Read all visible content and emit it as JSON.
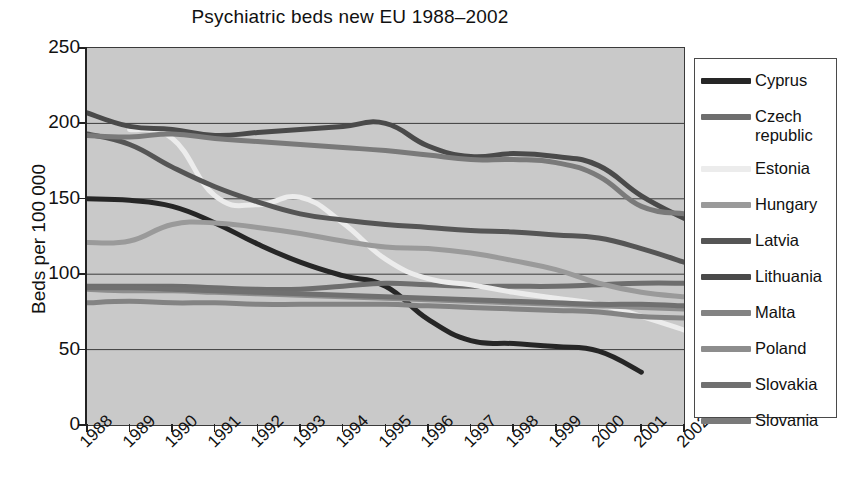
{
  "chart_data": {
    "type": "line",
    "title": "Psychiatric beds new EU 1988–2002",
    "xlabel": "",
    "ylabel": "Beds per 100 000",
    "x": [
      1988,
      1989,
      1990,
      1991,
      1992,
      1993,
      1994,
      1995,
      1996,
      1997,
      1998,
      1999,
      2000,
      2001,
      2002
    ],
    "xlim": [
      1988,
      2002
    ],
    "ylim": [
      0,
      250
    ],
    "yticks": [
      0,
      50,
      100,
      150,
      200,
      250
    ],
    "xticks": [
      "1988",
      "1989",
      "1990",
      "1991",
      "1992",
      "1993",
      "1994",
      "1995",
      "1996",
      "1997",
      "1998",
      "1999",
      "2000",
      "2001",
      "2002"
    ],
    "grid": "horizontal",
    "legend_position": "right",
    "plot_background": "#c9c9c9",
    "series": [
      {
        "name": "Cyprus",
        "color": "#262626",
        "values": [
          150,
          149,
          145,
          134,
          120,
          108,
          99,
          92,
          70,
          56,
          54,
          52,
          49,
          35,
          null
        ]
      },
      {
        "name": "Czech republic",
        "color": "#6e6e6e",
        "values": [
          92,
          92,
          92,
          91,
          90,
          90,
          92,
          94,
          93,
          92,
          92,
          92,
          93,
          94,
          94
        ]
      },
      {
        "name": "Estonia",
        "color": "#ececec",
        "values": [
          null,
          196,
          190,
          152,
          146,
          151,
          134,
          110,
          97,
          93,
          88,
          84,
          80,
          72,
          63
        ]
      },
      {
        "name": "Hungary",
        "color": "#9a9a9a",
        "values": [
          121,
          122,
          133,
          134,
          131,
          127,
          122,
          118,
          117,
          114,
          109,
          103,
          94,
          88,
          85
        ]
      },
      {
        "name": "Latvia",
        "color": "#555555",
        "values": [
          193,
          186,
          171,
          158,
          148,
          140,
          136,
          133,
          131,
          129,
          128,
          126,
          124,
          117,
          108
        ]
      },
      {
        "name": "Lithuania",
        "color": "#4a4a4a",
        "values": [
          207,
          198,
          196,
          192,
          194,
          196,
          198,
          200,
          185,
          178,
          180,
          178,
          172,
          152,
          137
        ]
      },
      {
        "name": "Malta",
        "color": "#838383",
        "values": [
          81,
          82,
          81,
          81,
          80,
          80,
          80,
          80,
          79,
          78,
          77,
          76,
          75,
          72,
          71
        ]
      },
      {
        "name": "Poland",
        "color": "#8d8d8d",
        "values": [
          90,
          89,
          89,
          88,
          87,
          86,
          85,
          84,
          83,
          82,
          81,
          80,
          79,
          78,
          77
        ]
      },
      {
        "name": "Slovakia",
        "color": "#707070",
        "values": [
          91,
          91,
          90,
          89,
          88,
          87,
          86,
          85,
          84,
          83,
          82,
          81,
          80,
          80,
          79
        ]
      },
      {
        "name": "Slovania",
        "color": "#7a7a7a",
        "values": [
          192,
          191,
          193,
          190,
          188,
          186,
          184,
          182,
          179,
          176,
          176,
          174,
          165,
          145,
          140
        ]
      }
    ]
  },
  "legend": {
    "items": [
      {
        "label": "Cyprus",
        "color": "#262626"
      },
      {
        "label": "Czech republic",
        "color": "#6e6e6e"
      },
      {
        "label": "Estonia",
        "color": "#ececec"
      },
      {
        "label": "Hungary",
        "color": "#9a9a9a"
      },
      {
        "label": "Latvia",
        "color": "#555555"
      },
      {
        "label": "Lithuania",
        "color": "#4a4a4a"
      },
      {
        "label": "Malta",
        "color": "#838383"
      },
      {
        "label": "Poland",
        "color": "#8d8d8d"
      },
      {
        "label": "Slovakia",
        "color": "#707070"
      },
      {
        "label": "Slovania",
        "color": "#7a7a7a"
      }
    ]
  }
}
